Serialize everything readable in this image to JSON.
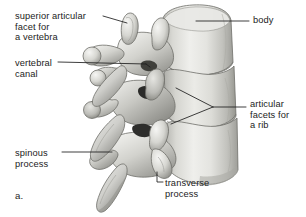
{
  "figure": {
    "panel_letter": "a.",
    "background_color": "#ffffff",
    "ink_color": "#1c1c1c",
    "bone_highlight_color": "#efefec",
    "bone_midtone_color": "#c8c8c4",
    "bone_shadow_color": "#8e8e8a",
    "bone_deep_shadow_color": "#3a3a38",
    "outline_color": "#6d6d69"
  },
  "labels": [
    {
      "id": "superior-articular-facet",
      "lines": [
        "superior articular",
        "facet for",
        "a vertebra"
      ],
      "text": "superior articular facet for a vertebra",
      "side": "left",
      "leader": "straight"
    },
    {
      "id": "vertebral-canal",
      "lines": [
        "vertebral",
        "canal"
      ],
      "text": "vertebral canal",
      "side": "left",
      "leader": "straight"
    },
    {
      "id": "spinous-process",
      "lines": [
        "spinous",
        "process"
      ],
      "text": "spinous process",
      "side": "left",
      "leader": "straight"
    },
    {
      "id": "body",
      "lines": [
        "body"
      ],
      "text": "body",
      "side": "right",
      "leader": "straight"
    },
    {
      "id": "articular-facets-for-a-rib",
      "lines": [
        "articular",
        "facets for",
        "a rib"
      ],
      "text": "articular facets for a rib",
      "side": "right",
      "leader": "forked"
    },
    {
      "id": "transverse-process",
      "lines": [
        "transverse",
        "process"
      ],
      "text": "transverse process",
      "side": "bottom",
      "leader": "elbow"
    }
  ],
  "label_text": {
    "superior_articular_facet_l1": "superior articular",
    "superior_articular_facet_l2": "facet for",
    "superior_articular_facet_l3": "a vertebra",
    "vertebral_canal_l1": "vertebral",
    "vertebral_canal_l2": "canal",
    "spinous_process_l1": "spinous",
    "spinous_process_l2": "process",
    "body_l1": "body",
    "articular_facets_rib_l1": "articular",
    "articular_facets_rib_l2": "facets for",
    "articular_facets_rib_l3": "a rib",
    "transverse_process_l1": "transverse",
    "transverse_process_l2": "process",
    "panel_letter": "a."
  }
}
